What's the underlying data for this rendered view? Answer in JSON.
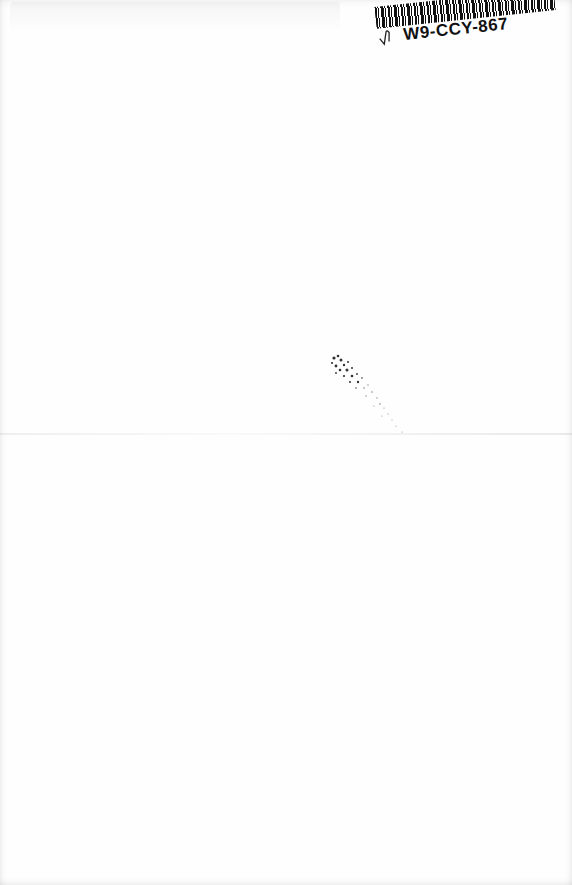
{
  "document": {
    "type": "scanned blank page",
    "background_color": "#fefefe"
  },
  "sticker": {
    "code": "W9-CCY-867",
    "barcode_color": "#111111",
    "has_handwritten_tick": true
  },
  "marks": {
    "ink_speckle": "scattered dots near center",
    "fold_line": "faint horizontal crease"
  }
}
